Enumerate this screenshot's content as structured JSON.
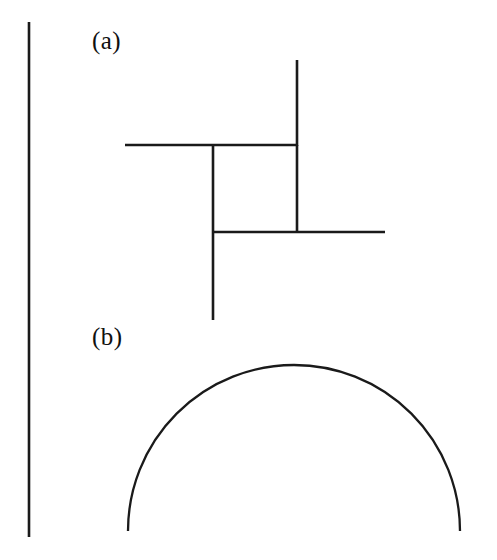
{
  "figure": {
    "background_color": "#ffffff",
    "ink_color": "#1a1a1a",
    "width": 497,
    "height": 560,
    "panels": [
      {
        "id": "panel-a",
        "label": "(a)",
        "label_position": {
          "x": 92,
          "y": 28
        },
        "description": "pinwheel line figure",
        "segments": [
          {
            "name": "top-vertical-stroke",
            "orientation": "vertical",
            "x1": 297,
            "y1": 60,
            "x2": 297,
            "y2": 145
          },
          {
            "name": "upper-horizontal-stroke",
            "orientation": "horizontal",
            "x1": 125,
            "y1": 145,
            "x2": 297,
            "y2": 145
          },
          {
            "name": "inner-right-vertical",
            "orientation": "vertical",
            "x1": 297,
            "y1": 145,
            "x2": 297,
            "y2": 232
          },
          {
            "name": "left-vertical-stroke",
            "orientation": "vertical",
            "x1": 213,
            "y1": 145,
            "x2": 213,
            "y2": 320
          },
          {
            "name": "lower-horizontal-stroke",
            "orientation": "horizontal",
            "x1": 213,
            "y1": 232,
            "x2": 385,
            "y2": 232
          }
        ]
      },
      {
        "id": "panel-b",
        "label": "(b)",
        "label_position": {
          "x": 92,
          "y": 324
        },
        "description": "semicircular dome arc",
        "arc": {
          "name": "dome-arc",
          "center_x": 294,
          "center_y": 531,
          "radius": 166,
          "start_x": 128,
          "start_y": 531,
          "end_x": 460,
          "end_y": 531,
          "apex_x": 294,
          "apex_y": 365
        }
      }
    ],
    "border_rule": {
      "name": "left-border-rule",
      "orientation": "vertical",
      "x1": 29,
      "y1": 22,
      "x2": 29,
      "y2": 537
    }
  }
}
